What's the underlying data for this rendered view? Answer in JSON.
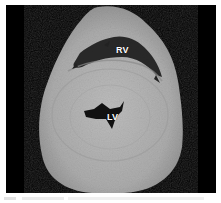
{
  "image": {
    "subject": "Transverse section of heart specimen",
    "background_color": "#000000",
    "tissue_color": "#b4b4b4",
    "labels": {
      "rv": "RV",
      "lv": "LV"
    }
  }
}
